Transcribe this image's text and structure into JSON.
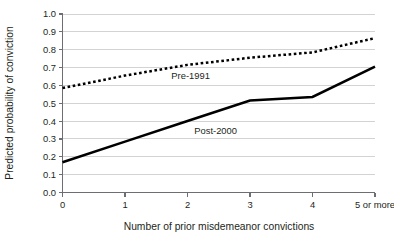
{
  "chart_data": {
    "type": "line",
    "title": "",
    "subtitle": "",
    "xlabel": "Number of prior misdemeanor convictions",
    "ylabel": "Predicted probability of conviction",
    "categories": [
      "0",
      "1",
      "2",
      "3",
      "4",
      "5 or more"
    ],
    "x": [
      0,
      1,
      2,
      3,
      4,
      5
    ],
    "ylim": [
      0.0,
      1.0
    ],
    "ytick_labels": [
      "0.0",
      "0.1",
      "0.2",
      "0.3",
      "0.4",
      "0.5",
      "0.6",
      "0.7",
      "0.8",
      "0.9",
      "1.0"
    ],
    "ytick_values": [
      0.0,
      0.1,
      0.2,
      0.3,
      0.4,
      0.5,
      0.6,
      0.7,
      0.8,
      0.9,
      1.0
    ],
    "grid": true,
    "grid_axis": "y",
    "legend": "inline-labels",
    "legend_position": "on-plot",
    "series": [
      {
        "name": "Pre-1991",
        "style": "dotted",
        "color": "#000000",
        "values": [
          0.585,
          0.655,
          0.715,
          0.755,
          0.785,
          0.865
        ],
        "label_text": "Pre-1991",
        "label_x": 2.05,
        "label_y": 0.655
      },
      {
        "name": "Post-2000",
        "style": "solid",
        "color": "#000000",
        "values": [
          0.17,
          0.285,
          0.4,
          0.515,
          0.535,
          0.705
        ],
        "label_text": "Post-2000",
        "label_x": 2.45,
        "label_y": 0.345
      }
    ]
  },
  "axes": {
    "y_title": "Predicted probability of conviction",
    "x_title": "Number of prior misdemeanor convictions"
  }
}
